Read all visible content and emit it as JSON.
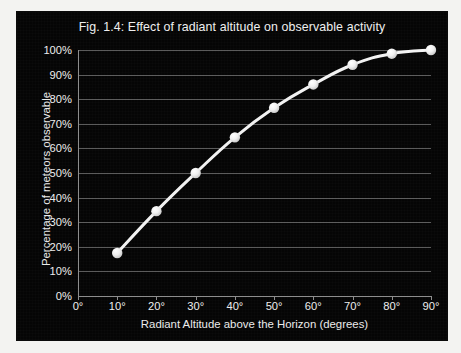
{
  "figure": {
    "panel_background": "#050505",
    "page_background": "#f3f3f1",
    "series_color": "#f2f2f2",
    "gridline_color": "#5b5b5b",
    "axis_color": "#8d8d8d",
    "text_color": "#ededed"
  },
  "chart_data": {
    "type": "line",
    "title": "Fig. 1.4: Effect of radiant altitude on observable activity",
    "subtitle": "",
    "xlabel": "Radiant Altitude above the Horizon (degrees)",
    "ylabel": "Percentage of meteors  observable",
    "x": [
      10,
      20,
      30,
      40,
      50,
      60,
      70,
      80,
      90
    ],
    "values": [
      17.5,
      34.5,
      50,
      64.5,
      76.5,
      86,
      94,
      98.5,
      100
    ],
    "xlim": [
      0,
      90
    ],
    "ylim": [
      0,
      100
    ],
    "x_ticks": [
      0,
      10,
      20,
      30,
      40,
      50,
      60,
      70,
      80,
      90
    ],
    "x_tick_labels": [
      "0°",
      "10°",
      "20°",
      "30°",
      "40°",
      "50°",
      "60°",
      "70°",
      "80°",
      "90°"
    ],
    "y_ticks": [
      0,
      10,
      20,
      30,
      40,
      50,
      60,
      70,
      80,
      90,
      100
    ],
    "y_tick_labels": [
      "0%",
      "10%",
      "20%",
      "30%",
      "40%",
      "50%",
      "60%",
      "70%",
      "80%",
      "90%",
      "100%"
    ],
    "grid": "horizontal",
    "legend": "none",
    "markers": "circle",
    "marker_color": "#fbfbfb",
    "line_color": "#f2f2f2",
    "line_width": 3
  }
}
